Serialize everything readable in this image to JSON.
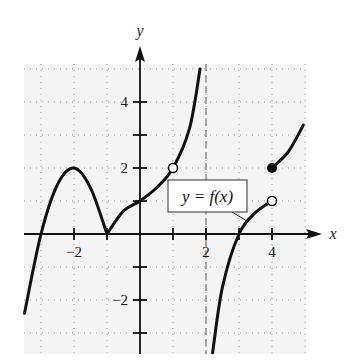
{
  "chart_data": {
    "type": "line",
    "title": "",
    "xlabel": "x",
    "ylabel": "y",
    "xlim": [
      -3.5,
      5
    ],
    "ylim": [
      -3.6,
      5
    ],
    "grid": true,
    "x_tick_labels": [
      "-2",
      "2",
      "4"
    ],
    "y_tick_labels": [
      "4",
      "2",
      "-2"
    ],
    "x_ticks": [
      -2,
      -1,
      1,
      2,
      3,
      4
    ],
    "y_ticks": [
      -3,
      -2,
      -1,
      1,
      2,
      3,
      4
    ],
    "annotation": "y = f(x)",
    "vertical_asymptote": {
      "x": 2,
      "style": "dashed"
    },
    "series": [
      {
        "name": "f(x) piece 1",
        "points": [
          [
            -3.5,
            -2.4
          ],
          [
            -3,
            0
          ],
          [
            -2.5,
            1.5
          ],
          [
            -2,
            2
          ],
          [
            -1.5,
            1.4
          ],
          [
            -1,
            0
          ]
        ]
      },
      {
        "name": "f(x) piece 2",
        "points": [
          [
            -1,
            0
          ],
          [
            -0.5,
            0.7
          ],
          [
            0,
            1
          ],
          [
            0.5,
            1.4
          ],
          [
            1,
            2
          ],
          [
            1.5,
            3.2
          ],
          [
            1.82,
            5
          ]
        ]
      },
      {
        "name": "f(x) piece 3",
        "points": [
          [
            2.2,
            -3.6
          ],
          [
            2.5,
            -1.6
          ],
          [
            3,
            0
          ],
          [
            3.5,
            0.65
          ],
          [
            4,
            1
          ]
        ]
      },
      {
        "name": "f(x) piece 4",
        "points": [
          [
            4,
            2
          ],
          [
            4.5,
            2.5
          ],
          [
            4.95,
            3.3
          ]
        ]
      }
    ],
    "open_points": [
      [
        1,
        2
      ],
      [
        4,
        1
      ]
    ],
    "closed_points": [
      [
        4,
        2
      ]
    ]
  },
  "labels": {
    "x_axis": "x",
    "y_axis": "y",
    "function_label": "y = f(x)",
    "tick_x_neg2": "−2",
    "tick_x_2": "2",
    "tick_x_4": "4",
    "tick_y_4": "4",
    "tick_y_2": "2",
    "tick_y_neg2": "−2"
  }
}
